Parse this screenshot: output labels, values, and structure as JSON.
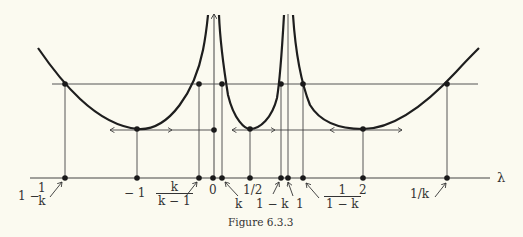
{
  "figure": {
    "caption": "Figure 6.3.3",
    "axis_label": "λ",
    "labels": {
      "one_minus_inv_k_whole": "1 −",
      "one_minus_inv_k_num": "1",
      "one_minus_inv_k_den": "k",
      "minus_one": "− 1",
      "k_over_km1_num": "k",
      "k_over_km1_den": "k − 1",
      "zero": "0",
      "k": "k",
      "half": "1/2",
      "one_minus_k": "1 − k",
      "one": "1",
      "inv_1mk_num": "1",
      "inv_1mk_den": "1 − k",
      "two": "2",
      "inv_k": "1/k"
    },
    "colors": {
      "background": "#fbfaf0",
      "ink": "#222222"
    }
  }
}
